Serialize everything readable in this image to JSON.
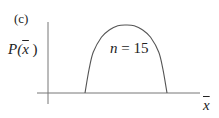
{
  "chart_data": {
    "type": "line",
    "title": "",
    "panel_label": "(c)",
    "xlabel": "x̄",
    "ylabel": "P(x̄)",
    "annotation": "n = 15",
    "grid": false,
    "legend": null,
    "axis_ticks": [],
    "x": [
      0.0,
      0.05,
      0.1,
      0.2,
      0.3,
      0.4,
      0.5,
      0.6,
      0.7,
      0.8,
      0.9,
      0.95,
      1.0
    ],
    "values": [
      0.0,
      0.35,
      0.6,
      0.82,
      0.93,
      0.99,
      1.0,
      0.99,
      0.93,
      0.82,
      0.6,
      0.35,
      0.0
    ],
    "ylim": [
      0,
      1.1
    ],
    "colors": {
      "line": "#555555",
      "axes": "#777777",
      "text": "#222222"
    }
  },
  "labels": {
    "panel": "(c)",
    "y_prefix": "P(",
    "y_var": "x",
    "y_suffix": " )",
    "annotation_var": "n",
    "annotation_rest": " = 15",
    "x_var": "x"
  }
}
